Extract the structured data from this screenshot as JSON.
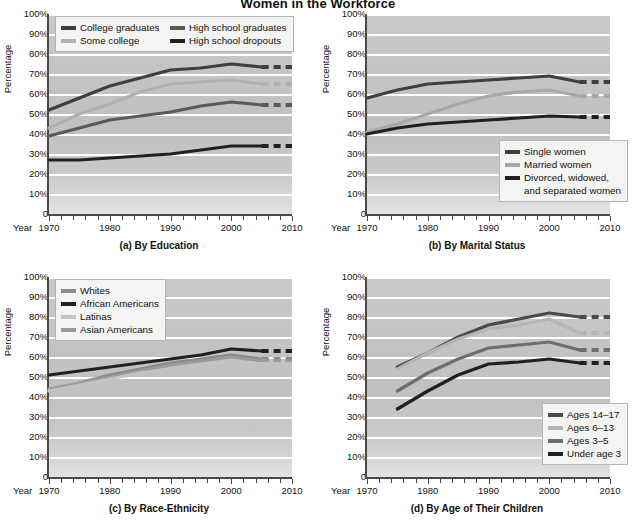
{
  "figure": {
    "title": "Women in the Workforce",
    "ylabel": "Percentage",
    "year_word": "Year",
    "ytick_labels": [
      "100%",
      "90%",
      "80%",
      "70%",
      "60%",
      "50%",
      "40%",
      "30%",
      "20%",
      "10%",
      "0"
    ],
    "xtick_labels": [
      "1970",
      "1980",
      "1990",
      "2000",
      "2010"
    ],
    "colors": {
      "very_dark": "#231f20",
      "dark": "#3f3f3f",
      "medium": "#6e6e6e",
      "light": "#a8a8a8",
      "very_light": "#c3c3c3",
      "plot_bg": "#c4c4c4",
      "gridline": "#ffffff",
      "axis": "#4a4a4a",
      "legend_bg": "#f4f4f2",
      "legend_border": "#b5b5b5",
      "page_bg": "#ffffff"
    }
  },
  "panels": [
    {
      "id": "a",
      "caption": "(a) By Education",
      "legend_position": "top-left",
      "legend_columns": 2,
      "legend": [
        {
          "label": "College graduates",
          "color": "#3f3f3f"
        },
        {
          "label": "High school graduates",
          "color": "#5a5a5a"
        },
        {
          "label": "Some college",
          "color": "#b0b0b0"
        },
        {
          "label": "High school dropouts",
          "color": "#231f20"
        }
      ]
    },
    {
      "id": "b",
      "caption": "(b) By Marital Status",
      "legend_position": "bottom-right",
      "legend_columns": 1,
      "legend": [
        {
          "label": "Single women",
          "color": "#3f3f3f"
        },
        {
          "label": "Married women",
          "color": "#a8a8a8"
        },
        {
          "label": "Divorced, widowed,",
          "label2": "and separated women",
          "color": "#231f20"
        }
      ]
    },
    {
      "id": "c",
      "caption": "(c) By Race-Ethnicity",
      "legend_position": "top-left",
      "legend_columns": 1,
      "legend": [
        {
          "label": "Whites",
          "color": "#8a8a8a"
        },
        {
          "label": "African Americans",
          "color": "#231f20"
        },
        {
          "label": "Latinas",
          "color": "#c3c3c3"
        },
        {
          "label": "Asian Americans",
          "color": "#9b9b9b"
        }
      ]
    },
    {
      "id": "d",
      "caption": "(d) By Age of Their Children",
      "legend_position": "bottom-right",
      "legend_columns": 1,
      "legend": [
        {
          "label": "Ages 14–17",
          "color": "#4a4a4a"
        },
        {
          "label": "Ages 6–13",
          "color": "#b5b5b5"
        },
        {
          "label": "Ages 3–5",
          "color": "#6e6e6e"
        },
        {
          "label": "Under age 3",
          "color": "#231f20"
        }
      ]
    }
  ],
  "chart_data": [
    {
      "type": "line",
      "id": "a",
      "title": "(a) By Education",
      "xlabel": "Year",
      "ylabel": "Percentage",
      "ylim": [
        0,
        100
      ],
      "xlim": [
        1970,
        2010
      ],
      "grid": true,
      "legend_position": "top-left",
      "x": [
        1970,
        1975,
        1980,
        1985,
        1990,
        1995,
        2000,
        2005
      ],
      "projection_x": [
        2005,
        2010
      ],
      "series": [
        {
          "name": "College graduates",
          "color": "#3f3f3f",
          "values": [
            52,
            58,
            64,
            68,
            72,
            73,
            75,
            73.5
          ],
          "projected_value": 73.5
        },
        {
          "name": "Some college",
          "color": "#b0b0b0",
          "values": [
            43,
            50,
            55,
            61,
            65,
            66,
            67,
            65
          ],
          "projected_value": 65
        },
        {
          "name": "High school graduates",
          "color": "#5a5a5a",
          "values": [
            39,
            43,
            47,
            49,
            51,
            54,
            56,
            54.5
          ],
          "projected_value": 54.5
        },
        {
          "name": "High school dropouts",
          "color": "#231f20",
          "values": [
            27,
            27,
            28,
            29,
            30,
            32,
            34,
            34
          ],
          "projected_value": 34
        }
      ]
    },
    {
      "type": "line",
      "id": "b",
      "title": "(b) By Marital Status",
      "xlabel": "Year",
      "ylabel": "Percentage",
      "ylim": [
        0,
        100
      ],
      "xlim": [
        1970,
        2010
      ],
      "grid": true,
      "legend_position": "bottom-right",
      "x": [
        1970,
        1975,
        1980,
        1985,
        1990,
        1995,
        2000,
        2005
      ],
      "projection_x": [
        2005,
        2010
      ],
      "series": [
        {
          "name": "Single women",
          "color": "#3f3f3f",
          "values": [
            58,
            62,
            65,
            66,
            67,
            68,
            69,
            66
          ],
          "projected_value": 66
        },
        {
          "name": "Married women",
          "color": "#a8a8a8",
          "values": [
            41,
            45,
            50,
            55,
            59,
            61,
            62,
            59
          ],
          "projected_value": 59
        },
        {
          "name": "Divorced, widowed, and separated women",
          "color": "#231f20",
          "values": [
            40,
            43,
            45,
            46,
            47,
            48,
            49,
            48.5
          ],
          "projected_value": 48.5
        }
      ]
    },
    {
      "type": "line",
      "id": "c",
      "title": "(c) By Race-Ethnicity",
      "xlabel": "Year",
      "ylabel": "Percentage",
      "ylim": [
        0,
        100
      ],
      "xlim": [
        1970,
        2010
      ],
      "grid": true,
      "legend_position": "top-left",
      "x": [
        1970,
        1975,
        1980,
        1985,
        1990,
        1995,
        2000,
        2005
      ],
      "projection_x": [
        2005,
        2010
      ],
      "series": [
        {
          "name": "African Americans",
          "color": "#231f20",
          "values": [
            51,
            53,
            55,
            57,
            59,
            61,
            64,
            63
          ],
          "projected_value": 63
        },
        {
          "name": "Whites",
          "color": "#8a8a8a",
          "values": [
            43,
            47,
            51,
            54,
            57,
            59,
            61,
            59
          ],
          "projected_value": 59
        },
        {
          "name": "Asian Americans",
          "color": "#9b9b9b",
          "values": [
            44,
            47,
            50,
            53,
            56,
            58,
            60,
            58
          ],
          "projected_value": 58
        },
        {
          "name": "Latinas",
          "color": "#c3c3c3",
          "values": [
            43,
            46,
            49,
            52,
            54,
            56,
            58,
            56.5
          ],
          "projected_value": 56.5
        }
      ]
    },
    {
      "type": "line",
      "id": "d",
      "title": "(d) By Age of Their Children",
      "xlabel": "Year",
      "ylabel": "Percentage",
      "ylim": [
        0,
        100
      ],
      "xlim": [
        1970,
        2010
      ],
      "grid": true,
      "legend_position": "bottom-right",
      "x": [
        1975,
        1980,
        1985,
        1990,
        1995,
        2000,
        2005
      ],
      "projection_x": [
        2005,
        2010
      ],
      "series": [
        {
          "name": "Ages 14–17",
          "color": "#4a4a4a",
          "values": [
            55,
            62,
            70,
            76,
            79,
            82,
            80
          ],
          "projected_value": 80
        },
        {
          "name": "Ages 6–13",
          "color": "#b5b5b5",
          "values": [
            54,
            62,
            69,
            74,
            76,
            79,
            72
          ],
          "projected_value": 72
        },
        {
          "name": "Ages 3–5",
          "color": "#6e6e6e",
          "values": [
            43,
            52,
            59,
            64.5,
            66,
            67.5,
            63.5
          ],
          "projected_value": 63.5
        },
        {
          "name": "Under age 3",
          "color": "#231f20",
          "values": [
            34,
            43,
            51,
            56.5,
            57.5,
            59,
            57
          ],
          "projected_value": 57
        }
      ]
    }
  ]
}
